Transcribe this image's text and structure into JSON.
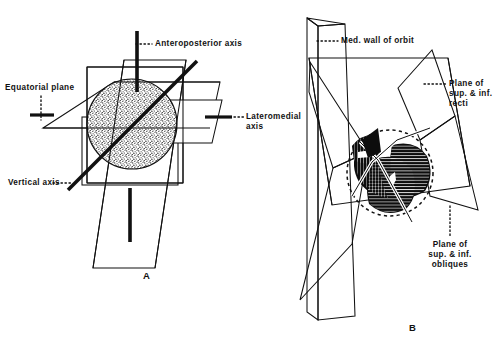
{
  "figure": {
    "background_color": "#ffffff",
    "ink_color": "#111111"
  },
  "panel_a": {
    "letter": "A",
    "labels": {
      "anteroposterior_axis": "Anteroposterior axis",
      "equatorial_plane": "Equatorial plane",
      "lateromedial_axis_line1": "Lateromedial",
      "lateromedial_axis_line2": "axis",
      "vertical_axis": "Vertical axis"
    }
  },
  "panel_b": {
    "letter": "B",
    "labels": {
      "med_wall_of_orbit": "Med. wall of orbit",
      "plane_recti_line1": "Plane of",
      "plane_recti_line2": "sup. & inf.",
      "plane_recti_line3": "recti",
      "plane_obliques_line1": "Plane of",
      "plane_obliques_line2": "sup. & inf.",
      "plane_obliques_line3": "obliques"
    }
  }
}
